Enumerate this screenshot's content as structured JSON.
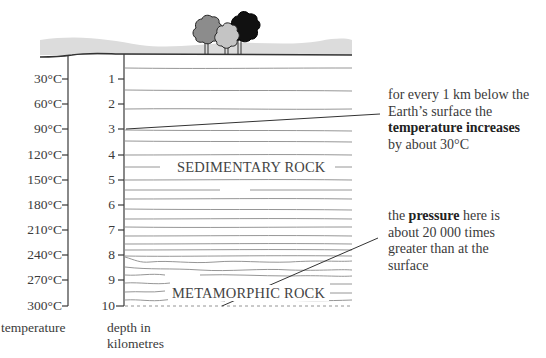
{
  "temperature_axis": {
    "title": "temperature",
    "ticks": [
      "30°C",
      "60°C",
      "90°C",
      "120°C",
      "150°C",
      "180°C",
      "210°C",
      "240°C",
      "270°C",
      "300°C"
    ]
  },
  "depth_axis": {
    "title_line1": "depth in",
    "title_line2": "kilometres",
    "ticks": [
      "1",
      "2",
      "3",
      "4",
      "5",
      "6",
      "7",
      "8",
      "9",
      "10"
    ]
  },
  "layers": {
    "upper": "SEDIMENTARY ROCK",
    "lower": "METAMORPHIC ROCK"
  },
  "annotations": {
    "temperature": {
      "line1": "for every 1 km below the",
      "line2": "Earth’s surface the",
      "bold": "temperature increases",
      "line4": "by about 30°C"
    },
    "pressure": {
      "pre": "the ",
      "bold": "pressure",
      "post": " here is",
      "line2": "about 20 000 times",
      "line3": "greater than at the",
      "line4": "surface"
    }
  },
  "surface": {
    "trees": [
      "grey-tree",
      "light-grey-tree",
      "black-tree"
    ]
  },
  "colors": {
    "ground_band": "#dcdcdc",
    "strata_line": "#8a8a8a",
    "axis": "#3a3a3a",
    "tree_dark_grey": "#8c8c8c",
    "tree_light_grey": "#c4c4c4",
    "tree_black": "#111111"
  }
}
